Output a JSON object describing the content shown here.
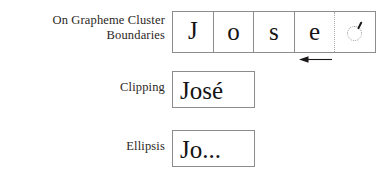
{
  "figure": {
    "rows": [
      {
        "label": "On Grapheme Cluster\nBoundaries",
        "box_kind": "grapheme-cell-strip",
        "cells": [
          {
            "glyph": "J",
            "kind": "letter"
          },
          {
            "glyph": "o",
            "kind": "letter"
          },
          {
            "glyph": "s",
            "kind": "letter"
          },
          {
            "glyph": "e",
            "kind": "letter"
          },
          {
            "glyph": "◌́",
            "kind": "combining-accent-placeholder"
          }
        ],
        "annotation": {
          "icon": "arrow-left-icon",
          "direction": "left",
          "meaning": "truncation moves backward to the previous grapheme cluster boundary"
        },
        "divider_before_last_cell": "dotted"
      },
      {
        "label": "Clipping",
        "box_kind": "text-box",
        "text": "José"
      },
      {
        "label": "Ellipsis",
        "box_kind": "text-box",
        "text": "Jo..."
      }
    ]
  },
  "colors": {
    "background": "#ffffff",
    "text": "#231f20",
    "glyph": "#151314",
    "box_border": "#8c8c8c",
    "dotted_divider": "#a9a9a9",
    "placeholder_ring": "#9a9a9a",
    "arrow": "#1b1819"
  }
}
